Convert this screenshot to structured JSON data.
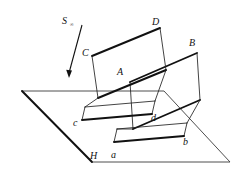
{
  "figure": {
    "title": "",
    "labels": {
      "light_source": "S",
      "light_source_sub": "∞",
      "vertex_A": "A",
      "vertex_B": "B",
      "vertex_C": "C",
      "vertex_D": "D",
      "shadow_a": "a",
      "shadow_b": "b",
      "shadow_c": "c",
      "shadow_d": "d",
      "plane_H": "H"
    },
    "colors": {
      "ink": "#111111",
      "plane_line": "#3a3a3a",
      "background": "#ffffff"
    },
    "geometry": {
      "ground_plane_H": [
        [
          22,
          91
        ],
        [
          164,
          91
        ],
        [
          230,
          162
        ],
        [
          92,
          162
        ]
      ],
      "parallelogram_ACcd_front": [
        [
          92,
          56
        ],
        [
          160,
          28
        ],
        [
          166,
          70
        ],
        [
          98,
          98
        ]
      ],
      "parallelogram_ABb_back": [
        [
          130,
          82
        ],
        [
          197,
          53
        ],
        [
          200,
          100
        ],
        [
          133,
          129
        ]
      ],
      "shadow_quad_left": [
        [
          82,
          120
        ],
        [
          152,
          114
        ],
        [
          155,
          101
        ],
        [
          85,
          107
        ]
      ],
      "shadow_quad_right": [
        [
          114,
          142
        ],
        [
          184,
          136
        ],
        [
          187,
          123
        ],
        [
          117,
          129
        ]
      ],
      "drop_lines": [
        [
          [
            92,
            56
          ],
          [
            85,
            107
          ]
        ],
        [
          [
            160,
            28
          ],
          [
            155,
            101
          ]
        ],
        [
          [
            130,
            82
          ],
          [
            117,
            129
          ]
        ],
        [
          [
            197,
            53
          ],
          [
            187,
            123
          ]
        ],
        [
          [
            98,
            98
          ],
          [
            82,
            120
          ]
        ],
        [
          [
            166,
            70
          ],
          [
            152,
            114
          ]
        ],
        [
          [
            133,
            129
          ],
          [
            114,
            142
          ]
        ],
        [
          [
            200,
            100
          ],
          [
            184,
            136
          ]
        ]
      ],
      "light_ray": {
        "from": [
          82,
          25
        ],
        "to": [
          68,
          76
        ]
      }
    },
    "label_positions": {
      "S": [
        64,
        22
      ],
      "A": [
        121,
        72
      ],
      "B": [
        191,
        44
      ],
      "C": [
        85,
        53
      ],
      "D": [
        155,
        22
      ],
      "a": [
        113,
        155
      ],
      "b": [
        185,
        141
      ],
      "c": [
        76,
        124
      ],
      "d": [
        153,
        118
      ],
      "H": [
        93,
        156
      ]
    }
  }
}
